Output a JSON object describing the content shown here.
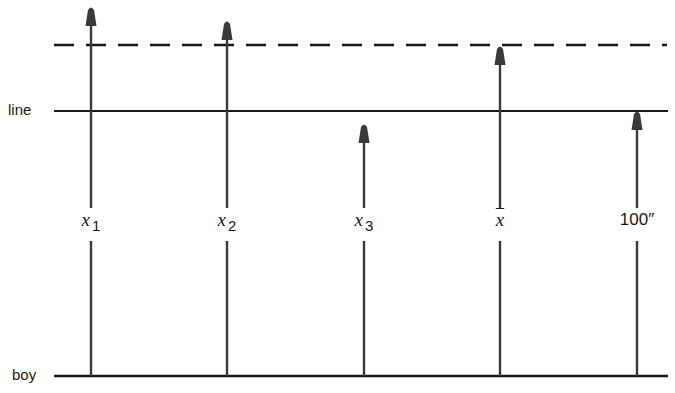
{
  "colors": {
    "ink": "#1a1a1a",
    "arrow": "#3a3a3a",
    "background": "#ffffff"
  },
  "levels": {
    "line": {
      "label": "line",
      "y": 111
    },
    "boy": {
      "label": "boy",
      "y": 376
    },
    "dashed": {
      "label": "",
      "y": 45
    }
  },
  "arrows": [
    {
      "id": "x1",
      "var": "x",
      "sub": "1",
      "bar": false,
      "x": 91,
      "tip_y": 6
    },
    {
      "id": "x2",
      "var": "x",
      "sub": "2",
      "bar": false,
      "x": 227,
      "tip_y": 20
    },
    {
      "id": "x3",
      "var": "x",
      "sub": "3",
      "bar": false,
      "x": 364,
      "tip_y": 123
    },
    {
      "id": "xbar",
      "var": "x",
      "sub": "",
      "bar": true,
      "x": 500,
      "tip_y": 45
    },
    {
      "id": "100in",
      "var": "",
      "sub": "",
      "text": "100″",
      "bar": false,
      "x": 637,
      "tip_y": 110
    }
  ],
  "label_gap": {
    "top": 208,
    "bottom": 241
  }
}
